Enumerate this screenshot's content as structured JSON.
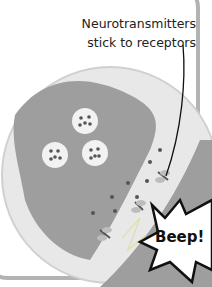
{
  "diagram": {
    "caption_line1": "Neurotransmitters",
    "caption_line2": "stick to receptors",
    "sound_effect": "Beep!",
    "elements": {
      "presynaptic_terminal": "axon-terminal",
      "vesicles": 3,
      "postsynaptic_cell": "receiving-neuron",
      "receptors": 3
    },
    "colors": {
      "cell": "#9e9e9e",
      "background_circle": "#e6e6e6",
      "vesicle": "#f2f2f2",
      "neurotransmitter": "#555555",
      "frame": "#b3b3b3"
    }
  }
}
